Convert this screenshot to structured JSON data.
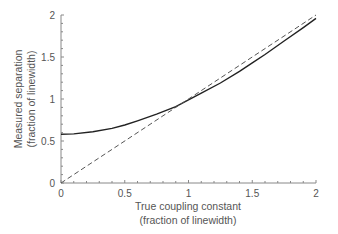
{
  "chart_data": {
    "type": "line",
    "title": "",
    "xlabel": "True coupling constant",
    "xlabel_sub": "(fraction of linewidth)",
    "ylabel": "Measured separation",
    "ylabel_sub": "(fraction of linewidth)",
    "xlim": [
      0,
      2
    ],
    "ylim": [
      0,
      2
    ],
    "xticks": [
      "0",
      "0.5",
      "1",
      "1.5",
      "2"
    ],
    "yticks": [
      "0",
      "0.5",
      "1",
      "1.5",
      "2"
    ],
    "grid": false,
    "legend": null,
    "series": [
      {
        "name": "Measured separation",
        "style": "solid",
        "color": "#222222",
        "x": [
          0,
          0.1,
          0.25,
          0.4,
          0.5,
          0.6,
          0.75,
          0.9,
          1.0,
          1.1,
          1.25,
          1.4,
          1.5,
          1.6,
          1.75,
          1.9,
          2.0
        ],
        "y": [
          0.58,
          0.585,
          0.61,
          0.65,
          0.69,
          0.74,
          0.82,
          0.91,
          0.99,
          1.07,
          1.19,
          1.33,
          1.43,
          1.53,
          1.69,
          1.85,
          1.96
        ]
      },
      {
        "name": "y = x (ideal)",
        "style": "dashed",
        "color": "#555555",
        "x": [
          0,
          2
        ],
        "y": [
          0,
          2
        ]
      }
    ]
  }
}
